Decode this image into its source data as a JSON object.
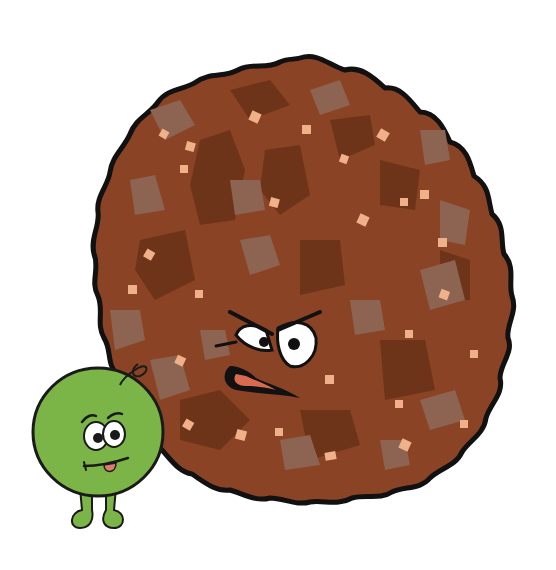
{
  "scene": {
    "description": "Cartoon of an angry meatball with a small nervous green pea beside it",
    "background": "#ffffff"
  },
  "characters": [
    {
      "name": "meatball",
      "expression": "angry",
      "colors": {
        "base": "#8a4325",
        "dark_patch": "#6e3419",
        "grey_patch": "#8d6452",
        "speck": "#f0b08a",
        "outline": "#111111"
      }
    },
    {
      "name": "pea",
      "expression": "nervous",
      "colors": {
        "body": "#7cb547",
        "outline": "#1a1a1a",
        "tongue": "#e07a6a"
      }
    }
  ]
}
